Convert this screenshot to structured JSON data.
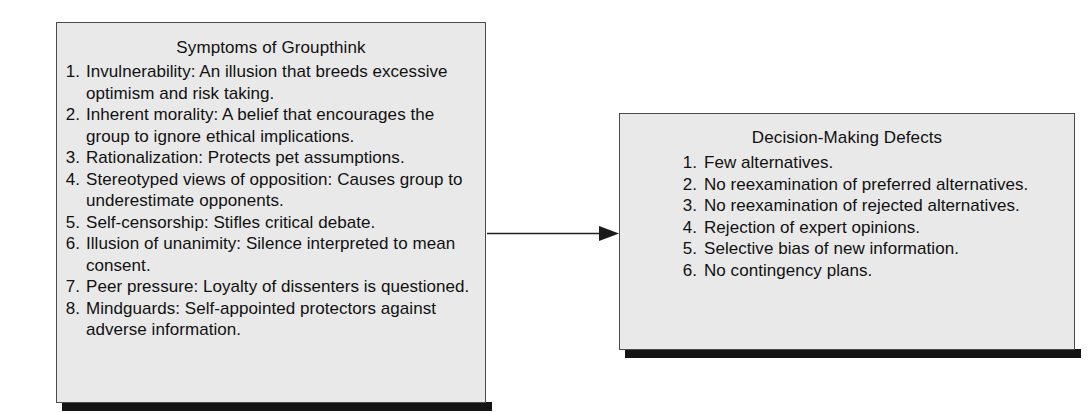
{
  "diagram": {
    "title_left": "Symptoms of Groupthink",
    "title_right": "Decision-Making Defects",
    "panel_fill": "#e9e9e9",
    "panel_border": "#4a4a4a",
    "shadow_color": "#141414",
    "arrow_color": "#222222",
    "page_background": "#ffffff"
  },
  "symptoms": {
    "title": "Symptoms of Groupthink",
    "items": [
      {
        "num": "1.",
        "text": "Invulnerability: An illusion that breeds excessive optimism and risk taking."
      },
      {
        "num": "2.",
        "text": "Inherent morality: A belief that encourages the group to ignore ethical implications."
      },
      {
        "num": "3.",
        "text": "Rationalization: Protects pet assumptions."
      },
      {
        "num": "4.",
        "text": "Stereotyped views of opposition: Causes group to underestimate opponents."
      },
      {
        "num": "5.",
        "text": "Self-censorship: Stifles critical debate."
      },
      {
        "num": "6.",
        "text": "Illusion of unanimity: Silence interpreted to mean consent."
      },
      {
        "num": "7.",
        "text": "Peer pressure: Loyalty of dissenters is questioned."
      },
      {
        "num": "8.",
        "text": "Mindguards: Self-appointed protectors against adverse information."
      }
    ]
  },
  "defects": {
    "title": "Decision-Making Defects",
    "items": [
      {
        "num": "1.",
        "text": "Few alternatives."
      },
      {
        "num": "2.",
        "text": "No reexamination of preferred alternatives."
      },
      {
        "num": "3.",
        "text": "No reexamination of rejected alternatives."
      },
      {
        "num": "4.",
        "text": "Rejection of expert opinions."
      },
      {
        "num": "5.",
        "text": "Selective bias of new information."
      },
      {
        "num": "6.",
        "text": "No contingency plans."
      }
    ]
  },
  "arrow": {
    "label": "leads-to"
  }
}
